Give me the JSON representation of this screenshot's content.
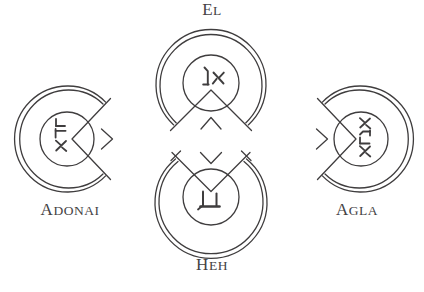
{
  "page": {
    "background_color": "#ffffff",
    "ink_color": "#3f3d3e",
    "width": 424,
    "height": 292
  },
  "labels": {
    "el": {
      "lead": "E",
      "rest": "L",
      "full": "EL"
    },
    "adonai": {
      "lead": "A",
      "rest": "DONAI",
      "full": "ADONAI"
    },
    "agla": {
      "lead": "A",
      "rest": "GLA",
      "full": "AGLA"
    },
    "heh": {
      "lead": "H",
      "rest": "EH",
      "full": "Heh"
    }
  },
  "sigils": [
    {
      "id": "el",
      "name": "EL",
      "position": "top",
      "label": "EL",
      "hebrew": "אל",
      "hebrew_name": "aleph-lamed",
      "gap_direction": "bottom",
      "chevron": "up",
      "center": {
        "x": 211,
        "y": 83
      },
      "outer_radius": 55,
      "inner_radius": 51,
      "core_radius": 28
    },
    {
      "id": "adonai",
      "name": "ADONAI",
      "position": "left",
      "label": "ADONAI",
      "hebrew": "אדני",
      "hebrew_name": "aleph-dalet-nun-yod",
      "gap_direction": "right",
      "chevron": "right",
      "center": {
        "x": 67,
        "y": 139
      },
      "outer_radius": 53,
      "inner_radius": 49,
      "core_radius": 27
    },
    {
      "id": "agla",
      "name": "AGLA",
      "position": "right",
      "label": "AGLA",
      "hebrew": "אגלא",
      "hebrew_name": "aleph-gimel-lamed-aleph",
      "gap_direction": "left",
      "chevron": "left",
      "center": {
        "x": 361,
        "y": 139
      },
      "outer_radius": 53,
      "inner_radius": 49,
      "core_radius": 27
    },
    {
      "id": "heh",
      "name": "Heh",
      "position": "bottom",
      "label": "Heh",
      "hebrew": "ה",
      "hebrew_name": "he",
      "gap_direction": "top",
      "chevron": "down",
      "center": {
        "x": 211,
        "y": 197
      },
      "outer_radius": 56,
      "inner_radius": 52,
      "core_radius": 28
    }
  ]
}
